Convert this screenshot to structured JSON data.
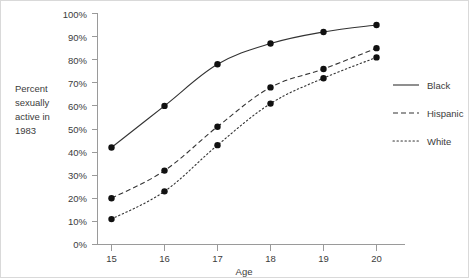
{
  "chart_data": {
    "type": "line",
    "title": "",
    "xlabel": "Age",
    "ylabel": "Percent sexually active in 1983",
    "ylabel_lines": [
      "Percent",
      "sexually",
      "active in",
      "1983"
    ],
    "x": [
      15,
      16,
      17,
      18,
      19,
      20
    ],
    "categories": [
      "15",
      "16",
      "17",
      "18",
      "19",
      "20"
    ],
    "xtick_labels": [
      "15",
      "16",
      "17",
      "18",
      "19",
      "20"
    ],
    "ytick_labels": [
      "0%",
      "10%",
      "20%",
      "30%",
      "40%",
      "50%",
      "60%",
      "70%",
      "80%",
      "90%",
      "100%"
    ],
    "ytick_values": [
      0,
      10,
      20,
      30,
      40,
      50,
      60,
      70,
      80,
      90,
      100
    ],
    "xlim": [
      14.6,
      20.5
    ],
    "ylim": [
      0,
      100
    ],
    "grid": false,
    "legend_position": "right",
    "markers": "filled-circle",
    "series": [
      {
        "name": "Black",
        "style": "solid",
        "color": "#333333",
        "values": [
          42,
          60,
          78,
          87,
          92,
          95
        ]
      },
      {
        "name": "Hispanic",
        "style": "dashed",
        "color": "#333333",
        "values": [
          20,
          32,
          51,
          68,
          76,
          85
        ]
      },
      {
        "name": "White",
        "style": "dotted",
        "color": "#333333",
        "values": [
          11,
          23,
          43,
          61,
          72,
          81
        ]
      }
    ]
  },
  "legend": {
    "items": [
      {
        "label": "Black",
        "style": "solid"
      },
      {
        "label": "Hispanic",
        "style": "dashed"
      },
      {
        "label": "White",
        "style": "dotted"
      }
    ]
  },
  "axes": {
    "x_title": "Age",
    "y_title_lines": [
      "Percent",
      "sexually",
      "active in",
      "1983"
    ]
  },
  "colors": {
    "line": "#333333",
    "axis": "#9a9a9a",
    "text": "#3c3c3c",
    "background": "#ffffff",
    "border": "#d9d9d9"
  }
}
